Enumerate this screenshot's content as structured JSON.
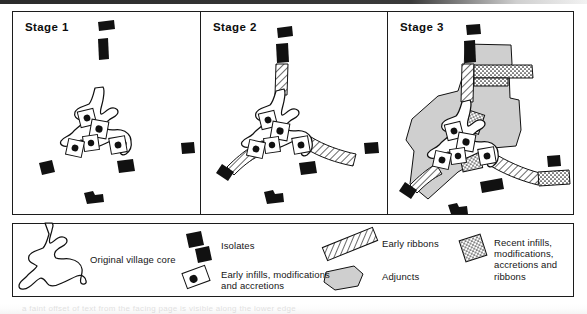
{
  "figure": {
    "panels": [
      {
        "id": "stage-1",
        "title": "Stage 1"
      },
      {
        "id": "stage-2",
        "title": "Stage 2"
      },
      {
        "id": "stage-3",
        "title": "Stage 3"
      }
    ]
  },
  "legend": {
    "entries": [
      {
        "key": "original-village-core",
        "label": "Original village core",
        "swatch": "village-core-outline-icon"
      },
      {
        "key": "isolates",
        "label": "Isolates",
        "swatch": "black-block-icon"
      },
      {
        "key": "early-infills",
        "label": "Early infills, modifications and accretions",
        "line1": "Early infills, modifications",
        "line2": "and accretions",
        "swatch": "infill-box-with-dot-icon"
      },
      {
        "key": "early-ribbons",
        "label": "Early ribbons",
        "swatch": "hatched-ribbon-icon"
      },
      {
        "key": "adjuncts",
        "label": "Adjuncts",
        "swatch": "grey-polygon-icon"
      },
      {
        "key": "recent-infills",
        "label": "Recent infills, modifications, accretions and ribbons",
        "line1": "Recent infills,",
        "line2": "modifications,",
        "line3": "accretions and ribbons",
        "swatch": "stippled-box-icon"
      }
    ]
  },
  "colors": {
    "ink": "#111111",
    "adjunct_fill": "#cfcfcf",
    "ribbon_fill": "#e9e9e9",
    "paper": "#ffffff"
  },
  "caption_ghost": "a faint offset of text from the facing page is visible along the lower edge"
}
